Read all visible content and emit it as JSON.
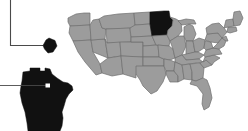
{
  "figure": {
    "title": "United States map with Minnesota highlighted and callout insets",
    "width": 248,
    "height": 131,
    "background_color": "#ffffff"
  },
  "colors": {
    "state_fill": "#9c9c9c",
    "state_border": "#6e6e6e",
    "highlight_fill": "#111111",
    "leader_line": "#4a4a4a",
    "pointer_marker": "#ffffff"
  },
  "map": {
    "name": "united-states-map",
    "highlighted_state": "Minnesota",
    "highlighted_state_color": "#111111",
    "other_states_color": "#9c9c9c"
  },
  "insets": [
    {
      "name": "county-inset",
      "shape_label": "Minnesota county detail",
      "fill_color": "#111111",
      "connector": "elbow-line-from-top-left"
    },
    {
      "name": "state-inset",
      "shape_label": "Minnesota state outline enlarged",
      "fill_color": "#111111",
      "connector": "straight-line-from-left",
      "marker_color": "#ffffff"
    }
  ],
  "annotations": {
    "leader_top_label": "",
    "leader_bottom_label": ""
  }
}
